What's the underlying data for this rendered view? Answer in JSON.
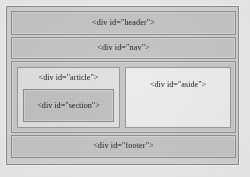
{
  "diagram": {
    "outer_container": {
      "name": "layout-box"
    },
    "blocks": {
      "header": "<div id=\"header\">",
      "nav": "<div id=\"nav\">",
      "article": "<div id=\"article\">",
      "section": "<div id=\"section\">",
      "aside": "<div id=\"aside\">",
      "footer": "<div id=\"footer\">"
    },
    "colors": {
      "page_background": "#ececeb",
      "container_fill": "#d3d3d1",
      "block_fill": "#c6c6c4",
      "light_block_fill": "#eeeeec",
      "article_fill": "#e2e2e0",
      "section_fill": "#c2c2c0",
      "border": "#919190",
      "text": "#1d1d1c"
    }
  }
}
